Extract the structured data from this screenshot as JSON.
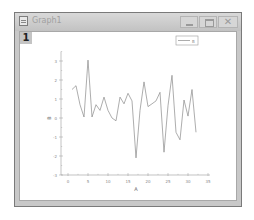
{
  "window": {
    "title": "Graph1",
    "layer_label": "1",
    "buttons": {
      "minimize": "minimize",
      "maximize": "maximize",
      "close": "✕"
    }
  },
  "colors": {
    "line": "#8a8a8a",
    "axis": "#9a9a9a",
    "frame": "#c8c8c8"
  },
  "chart_data": {
    "type": "line",
    "title": "",
    "xlabel": "A",
    "ylabel": "B",
    "xlim": [
      -2,
      35
    ],
    "ylim": [
      -3,
      3.5
    ],
    "xticks": [
      0,
      5,
      10,
      15,
      20,
      25,
      30,
      35
    ],
    "yticks": [
      3,
      2,
      1,
      0,
      -1,
      -2,
      -3
    ],
    "grid": false,
    "legend": {
      "position": "top-right",
      "entries": [
        "B"
      ]
    },
    "series": [
      {
        "name": "B",
        "x": [
          1,
          2,
          3,
          4,
          5,
          6,
          7,
          8,
          9,
          10,
          11,
          12,
          13,
          14,
          15,
          16,
          17,
          18,
          19,
          20,
          21,
          22,
          23,
          24,
          25,
          26,
          27,
          28,
          29,
          30,
          31,
          32
        ],
        "values": [
          1.5,
          1.7,
          0.7,
          0.05,
          3.05,
          0.05,
          0.7,
          0.4,
          1.1,
          0.4,
          0.0,
          -0.15,
          1.1,
          0.75,
          1.3,
          0.9,
          -2.1,
          0.4,
          1.9,
          0.6,
          0.75,
          0.9,
          1.35,
          -1.8,
          0.65,
          2.25,
          -0.75,
          -1.15,
          0.95,
          0.1,
          1.5,
          -0.75
        ]
      }
    ]
  }
}
